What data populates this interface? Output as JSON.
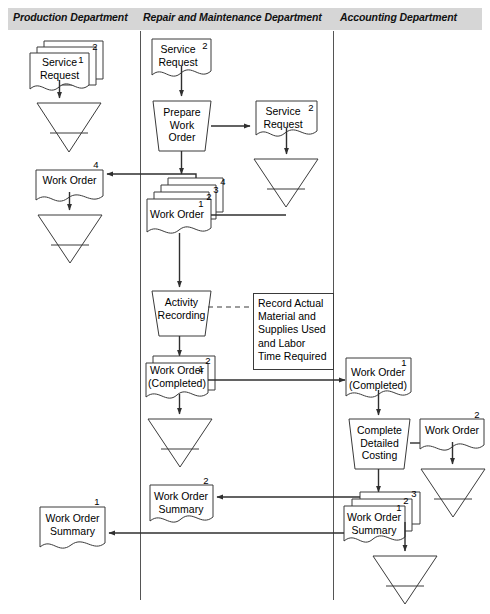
{
  "diagram": {
    "stroke_color": "#3a3a3a",
    "header_fill": "#d6d6d6",
    "lane_divider_color": "#555555"
  },
  "lanes": [
    {
      "id": "production",
      "label": "Production Department"
    },
    {
      "id": "repair",
      "label": "Repair and Maintenance Department"
    },
    {
      "id": "accounting",
      "label": "Accounting Department"
    }
  ],
  "nodes": {
    "prod_service_request": {
      "label": "Service\nRequest",
      "copies": [
        "1",
        "2"
      ]
    },
    "prod_file_1": {
      "label": ""
    },
    "prod_work_order_4": {
      "label": "Work Order",
      "copies": [
        "4"
      ]
    },
    "prod_file_2": {
      "label": ""
    },
    "prod_work_order_summary_1": {
      "label": "Work Order\nSummary",
      "copies": [
        "1"
      ]
    },
    "rm_service_request_2": {
      "label": "Service\nRequest",
      "copies": [
        "2"
      ]
    },
    "rm_prepare_work_order": {
      "label": "Prepare\nWork\nOrder"
    },
    "rm_service_request_out": {
      "label": "Service\nRequest",
      "copies": [
        "2"
      ]
    },
    "rm_file_service_request": {
      "label": ""
    },
    "rm_work_order_stack": {
      "label": "Work Order",
      "copies": [
        "1",
        "2",
        "3",
        "4"
      ]
    },
    "rm_activity_recording": {
      "label": "Activity\nRecording"
    },
    "rm_annotation": {
      "label": "Record Actual\nMaterial and\nSupplies Used\nand Labor\nTime Required"
    },
    "rm_work_order_completed": {
      "label": "Work Order\n(Completed)",
      "copies": [
        "1",
        "2"
      ]
    },
    "rm_file_completed": {
      "label": ""
    },
    "rm_work_order_summary_2": {
      "label": "Work Order\nSummary",
      "copies": [
        "2"
      ]
    },
    "acct_work_order_completed_1": {
      "label": "Work Order\n(Completed)",
      "copies": [
        "1"
      ]
    },
    "acct_complete_detailed_costing": {
      "label": "Complete\nDetailed\nCosting"
    },
    "acct_work_order_2": {
      "label": "Work Order",
      "copies": [
        "2"
      ]
    },
    "acct_file_work_order": {
      "label": ""
    },
    "acct_work_order_summary_stack": {
      "label": "Work Order\nSummary",
      "copies": [
        "1",
        "2",
        "3"
      ]
    },
    "acct_file_summary": {
      "label": ""
    }
  }
}
